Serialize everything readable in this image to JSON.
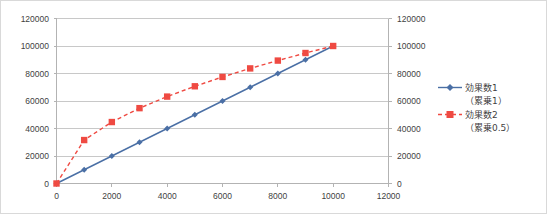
{
  "chart_data": {
    "type": "line",
    "title": "",
    "subtitle": "",
    "xlabel": "",
    "ylabel": "",
    "xlim": [
      0,
      12000
    ],
    "ylim": [
      0,
      120000
    ],
    "y2lim": [
      0,
      120000
    ],
    "grid": true,
    "legend_position": "right",
    "x_ticks": [
      "0",
      "2000",
      "4000",
      "6000",
      "8000",
      "10000",
      "12000"
    ],
    "x_tick_values": [
      0,
      2000,
      4000,
      6000,
      8000,
      10000,
      12000
    ],
    "y_ticks": [
      "0",
      "20000",
      "40000",
      "60000",
      "80000",
      "100000",
      "120000"
    ],
    "y_tick_values": [
      0,
      20000,
      40000,
      60000,
      80000,
      100000,
      120000
    ],
    "y2_ticks": [
      "0",
      "20000",
      "40000",
      "60000",
      "80000",
      "100000",
      "120000"
    ],
    "y2_tick_values": [
      0,
      20000,
      40000,
      60000,
      80000,
      100000,
      120000
    ],
    "x": [
      0,
      1000,
      2000,
      3000,
      4000,
      5000,
      6000,
      7000,
      8000,
      9000,
      10000
    ],
    "series": [
      {
        "name": "効果数1（累乗1）",
        "color": "#4a6fa5",
        "style": "solid",
        "marker": "diamond",
        "values": [
          0,
          10000,
          20000,
          30000,
          40000,
          50000,
          60000,
          70000,
          80000,
          90000,
          100000
        ]
      },
      {
        "name": "効果数2（累乗0.5）",
        "color": "#ef4a42",
        "style": "dashed",
        "marker": "square",
        "values": [
          0,
          31600,
          44700,
          54800,
          63200,
          70700,
          77500,
          83700,
          89400,
          94900,
          100000
        ]
      }
    ]
  },
  "legend": {
    "entries": [
      {
        "label_line1": "効果数1",
        "label_line2": "（累乗1）",
        "color": "#4a6fa5",
        "style": "solid",
        "marker": "diamond"
      },
      {
        "label_line1": "効果数2",
        "label_line2": "（累乗0.5）",
        "color": "#ef4a42",
        "style": "dashed",
        "marker": "square"
      }
    ]
  },
  "colors": {
    "series1": "#4a6fa5",
    "series2": "#ef4a42",
    "grid": "#c8c8c8",
    "axis": "#b3b3b3",
    "border": "#d9d9d9",
    "text": "#3f3f3f",
    "background": "#ffffff"
  }
}
